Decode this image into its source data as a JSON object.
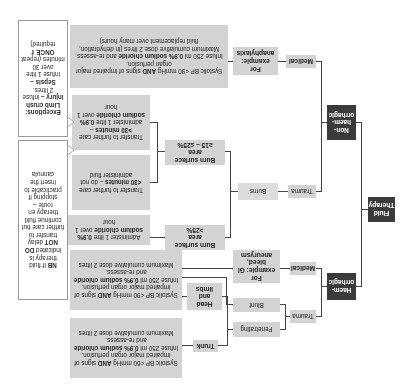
{
  "root": {
    "label": "Fluid Therapy"
  },
  "branches": {
    "non_haem": {
      "label": "Non-haem-orrhagic",
      "label_lines": [
        "Non-",
        "haem-",
        "orrhagic"
      ],
      "medical": {
        "label": "Medical",
        "example": "For example: anaphylaxis",
        "instructions": {
          "line1_pre": "Systolic BP <90 mmHg ",
          "line1_bold": "AND",
          "line1_post": " signs of impaired major organ perfusion.",
          "line2_pre": "Infuse 250 ml ",
          "line2_bold": "0.9% sodium chloride",
          "line2_post": " and re-assess.",
          "line3": "Maximum cumulative dose 2 litres (in dehydration, fluid replacement over many hours)"
        }
      },
      "trauma": {
        "label": "Trauma",
        "burns": {
          "label": "Burns",
          "mid": {
            "label_pre": "Burn surface area ",
            "label_value": "≥15 – ≤25%",
            "over30": {
              "pre": "Transfer to further care ",
              "bold": ">30 minutes",
              "mid": " – administer 1 litre ",
              "bold2": "0.9% sodium chloride",
              "post": " over 1 hour"
            },
            "under30": {
              "pre": "Transfer to further care ",
              "bold": "<30 minutes",
              "post": " – do not administer fluid"
            }
          },
          "large": {
            "label_pre": "Burn surface area ",
            "label_value": ">25%",
            "action_pre": "Administer 1 litre ",
            "action_bold": "0.9% sodium chloride",
            "action_post": " over 1 hour"
          }
        }
      }
    },
    "haem": {
      "label": "Haem-orrhagic",
      "label_lines": [
        "Haem-",
        "orrhagic"
      ],
      "medical": {
        "label": "Medical",
        "example": "For example: GI bleed, aneurysm"
      },
      "trauma": {
        "label": "Trauma",
        "blunt": "Blunt",
        "penetrating": "Penetrating",
        "head_limbs": "Head and limbs",
        "trunk": "Trunk"
      },
      "instructions_90": {
        "line1_pre": "Systolic BP <90 mmHg ",
        "line1_bold": "AND",
        "line1_post": " signs of impaired major organ perfusion.",
        "line2_pre": "Infuse 250 ml ",
        "line2_bold": "0.9% sodium chloride",
        "line2_post": " and re-assess.",
        "line3": "Maximum cumulative dose 2 litres"
      },
      "instructions_60": {
        "line1_pre": "Systolic BP <60 mmHg ",
        "line1_bold": "AND",
        "line1_post": " signs of impaired major organ perfusion.",
        "line2_pre": "Infuse 250 ml ",
        "line2_bold": "0.9% sodium chloride",
        "line2_post": " and re-assess.",
        "line3": "Maximum cumulative dose 2 litres"
      }
    }
  },
  "callouts": {
    "exceptions": {
      "title": "Exceptions:",
      "crush_bold": "Limb crush injury –",
      "crush_text": " infuse 2 litres.",
      "sepsis_bold": "Sepsis –",
      "sepsis_text": " infuse 1 litre over 30 minutes (repeat ",
      "once_bold": "ONCE",
      "sepsis_end": " if required)"
    },
    "en_route": {
      "text": "fluid therapy en route – stopping if practicable to insert the cannula",
      "pre": "but continue "
    },
    "nb": {
      "nb_bold": "NB",
      "pre": " If fluid therapy is indicated ",
      "donot_bold": "DO NOT",
      "post": " delay transfer to further care but continue fluid therapy en route – stopping if practicable to insert the cannula"
    }
  },
  "colors": {
    "dark_box": "#3b3b3b",
    "grey_box": "#d3d3d3",
    "line": "#444444",
    "background": "#ffffff"
  }
}
